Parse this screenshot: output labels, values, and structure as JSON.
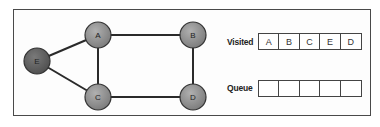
{
  "graph": {
    "nodes": [
      {
        "id": "A",
        "label": "A",
        "cx": 98,
        "cy": 35,
        "fill": "#8e8e8e"
      },
      {
        "id": "B",
        "label": "B",
        "cx": 193,
        "cy": 35,
        "fill": "#8e8e8e"
      },
      {
        "id": "C",
        "label": "C",
        "cx": 98,
        "cy": 97,
        "fill": "#8e8e8e"
      },
      {
        "id": "D",
        "label": "D",
        "cx": 193,
        "cy": 97,
        "fill": "#8e8e8e"
      },
      {
        "id": "E",
        "label": "E",
        "cx": 37,
        "cy": 61,
        "fill": "#5e5e5e"
      }
    ],
    "edges": [
      [
        "E",
        "A"
      ],
      [
        "E",
        "C"
      ],
      [
        "A",
        "B"
      ],
      [
        "A",
        "C"
      ],
      [
        "B",
        "D"
      ],
      [
        "C",
        "D"
      ]
    ]
  },
  "visited": {
    "label": "Visited",
    "cells": [
      "A",
      "B",
      "C",
      "E",
      "D"
    ]
  },
  "queue": {
    "label": "Queue",
    "cells": [
      "",
      "",
      "",
      "",
      ""
    ]
  }
}
